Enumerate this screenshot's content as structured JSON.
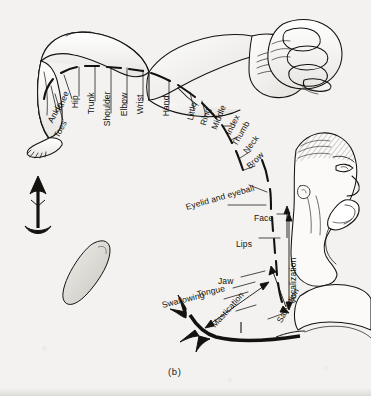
{
  "figure": {
    "caption": "(b)",
    "background_color": "#f3f2f0",
    "ink_color": "#141210"
  },
  "labels": {
    "body_map": [
      {
        "id": "toes",
        "text": "Toes",
        "x": 56,
        "y": 133,
        "rot": -62
      },
      {
        "id": "ankle",
        "text": "Ankle",
        "x": 50,
        "y": 118,
        "rot": -62
      },
      {
        "id": "knee",
        "text": "Knee",
        "x": 59,
        "y": 106,
        "rot": -68
      },
      {
        "id": "hip",
        "text": "Hip",
        "x": 75,
        "y": 104,
        "rot": -90
      },
      {
        "id": "trunk",
        "text": "Trunk",
        "x": 91,
        "y": 110,
        "rot": -90
      },
      {
        "id": "shoulder",
        "text": "Shoulder",
        "x": 107,
        "y": 122,
        "rot": -90
      },
      {
        "id": "elbow",
        "text": "Elbow",
        "x": 124,
        "y": 112,
        "rot": -90
      },
      {
        "id": "wrist",
        "text": "Wrist",
        "x": 140,
        "y": 110,
        "rot": -90
      },
      {
        "id": "hand",
        "text": "Hand",
        "x": 166,
        "y": 112,
        "rot": -90
      },
      {
        "id": "little",
        "text": "Little",
        "x": 190,
        "y": 116,
        "rot": -78
      },
      {
        "id": "ring",
        "text": "Ring",
        "x": 203,
        "y": 121,
        "rot": -74
      },
      {
        "id": "middle",
        "text": "Middle",
        "x": 214,
        "y": 125,
        "rot": -68
      },
      {
        "id": "index",
        "text": "Index",
        "x": 228,
        "y": 130,
        "rot": -64
      },
      {
        "id": "thumb",
        "text": "Thumb",
        "x": 234,
        "y": 141,
        "rot": -60
      },
      {
        "id": "neck",
        "text": "Neck",
        "x": 245,
        "y": 148,
        "rot": -52
      },
      {
        "id": "brow",
        "text": "Brow",
        "x": 248,
        "y": 163,
        "rot": -44
      },
      {
        "id": "eyelid-and-eyeball",
        "text": "Eyelid and eyeball",
        "x": 186,
        "y": 203,
        "rot": -16
      },
      {
        "id": "face",
        "text": "Face",
        "x": 254,
        "y": 214,
        "rot": 0
      },
      {
        "id": "lips",
        "text": "Lips",
        "x": 236,
        "y": 240,
        "rot": 0
      },
      {
        "id": "jaw",
        "text": "Jaw",
        "x": 218,
        "y": 277,
        "rot": 0
      },
      {
        "id": "tongue",
        "text": "Tongue",
        "x": 197,
        "y": 290,
        "rot": -12
      },
      {
        "id": "swallowing",
        "text": "Swallowing",
        "x": 168,
        "y": 300,
        "rot": -14
      }
    ],
    "rotated_vertical": [
      {
        "id": "vocalization",
        "text": "Vocalization",
        "x": 293,
        "y": 300,
        "rot": -90
      },
      {
        "id": "salivation",
        "text": "Salivation",
        "x": 279,
        "y": 318,
        "rot": -62
      },
      {
        "id": "mastication",
        "text": "Mastication",
        "x": 213,
        "y": 322,
        "rot": -48
      }
    ]
  }
}
